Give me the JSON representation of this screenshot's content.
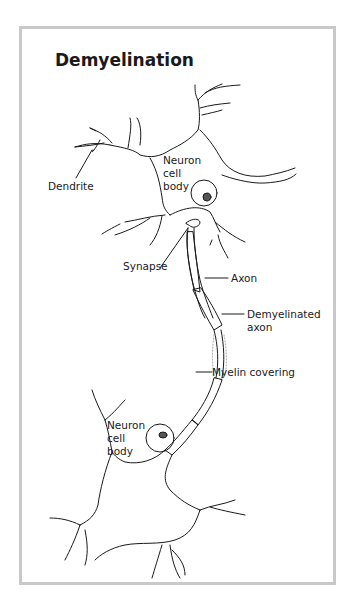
{
  "diagram": {
    "title": "Demyelination",
    "labels": {
      "dendrite": "Dendrite",
      "neuron_upper": [
        "Neuron",
        "cell",
        "body"
      ],
      "synapse": "Synapse",
      "axon": "Axon",
      "demyelinated": [
        "Demyelinated",
        "axon"
      ],
      "myelin": "Myelin covering",
      "neuron_lower": [
        "Neuron",
        "cell",
        "body"
      ]
    },
    "colors": {
      "stroke": "#1a1a1a",
      "frame": "#c9c9c9",
      "stipple": "#9a9a9a"
    }
  }
}
